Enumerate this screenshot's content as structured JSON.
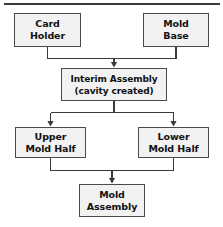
{
  "diagram": {
    "title_rule": "top-divider-rule",
    "background_color": "#ffffff",
    "node_fill_color": "#f2f2f2",
    "node_border_color": "#4a4a4a",
    "connector_color": "#3a3a3a",
    "text_color": "#111111",
    "nodes": [
      {
        "id": "card-holder",
        "line1": "Card",
        "line2": "Holder"
      },
      {
        "id": "mold-base",
        "line1": "Mold",
        "line2": "Base"
      },
      {
        "id": "interim",
        "line1": "Interim Assembly",
        "line2": "(cavity created)"
      },
      {
        "id": "upper",
        "line1": "Upper",
        "line2": "Mold Half"
      },
      {
        "id": "lower",
        "line1": "Lower",
        "line2": "Mold Half"
      },
      {
        "id": "mold-asm",
        "line1": "Mold",
        "line2": "Assembly"
      }
    ],
    "edges": [
      {
        "id": "card-holder-to-interim",
        "from": "card-holder",
        "to": "interim",
        "arrow": true
      },
      {
        "id": "mold-base-to-interim",
        "from": "mold-base",
        "to": "interim",
        "arrow": true
      },
      {
        "id": "interim-to-upper",
        "from": "interim",
        "to": "upper",
        "arrow": true
      },
      {
        "id": "interim-to-lower",
        "from": "interim",
        "to": "lower",
        "arrow": true
      },
      {
        "id": "upper-to-mold-assembly",
        "from": "upper",
        "to": "mold-asm",
        "arrow": true
      },
      {
        "id": "lower-to-mold-assembly",
        "from": "lower",
        "to": "mold-asm",
        "arrow": true
      }
    ]
  }
}
